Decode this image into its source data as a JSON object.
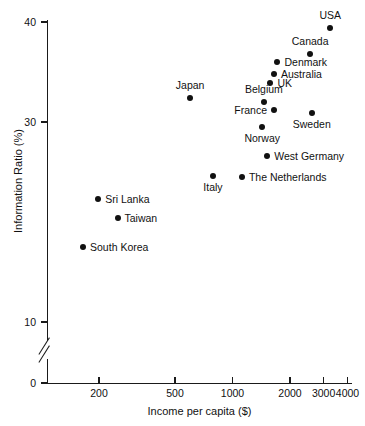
{
  "chart_data": {
    "type": "scatter",
    "title": "",
    "xlabel": "Income per capita ($)",
    "ylabel": "Information Ratio (%)",
    "x_scale": "log",
    "y_scale": "linear",
    "xlim": [
      150,
      4000
    ],
    "ylim": [
      0,
      41
    ],
    "y_axis_break": true,
    "y_break_between": [
      0,
      10
    ],
    "grid": false,
    "legend": "none",
    "xticks": [
      200,
      500,
      1000,
      2000,
      3000,
      4000
    ],
    "xtick_labels": [
      "200",
      "500",
      "1000",
      "2000",
      "3000",
      "4000"
    ],
    "yticks": [
      0,
      10,
      30,
      40
    ],
    "ytick_labels": [
      "0",
      "10",
      "30",
      "40"
    ],
    "points": [
      {
        "label": "USA",
        "x": 3250,
        "y": 39.4,
        "label_pos": "above"
      },
      {
        "label": "Canada",
        "x": 2550,
        "y": 36.8,
        "label_pos": "above"
      },
      {
        "label": "Denmark",
        "x": 1720,
        "y": 36.0,
        "label_pos": "right"
      },
      {
        "label": "Australia",
        "x": 1650,
        "y": 34.8,
        "label_pos": "right"
      },
      {
        "label": "UK",
        "x": 1580,
        "y": 33.9,
        "label_pos": "right"
      },
      {
        "label": "Japan",
        "x": 600,
        "y": 32.4,
        "label_pos": "above"
      },
      {
        "label": "Belgium",
        "x": 1460,
        "y": 32.0,
        "label_pos": "above"
      },
      {
        "label": "France",
        "x": 1650,
        "y": 31.2,
        "label_pos": "left"
      },
      {
        "label": "Sweden",
        "x": 2600,
        "y": 30.9,
        "label_pos": "below"
      },
      {
        "label": "Norway",
        "x": 1430,
        "y": 29.5,
        "label_pos": "below"
      },
      {
        "label": "West Germany",
        "x": 1520,
        "y": 26.6,
        "label_pos": "right"
      },
      {
        "label": "The Netherlands",
        "x": 1120,
        "y": 24.5,
        "label_pos": "right"
      },
      {
        "label": "Italy",
        "x": 790,
        "y": 24.6,
        "label_pos": "below"
      },
      {
        "label": "Sri Lanka",
        "x": 198,
        "y": 22.3,
        "label_pos": "right"
      },
      {
        "label": "Taiwan",
        "x": 250,
        "y": 20.4,
        "label_pos": "right"
      },
      {
        "label": "South Korea",
        "x": 165,
        "y": 17.5,
        "label_pos": "right"
      }
    ]
  },
  "colors": {
    "axis": "#1a1a1a",
    "marker": "#111111",
    "text": "#111111",
    "background": "#ffffff"
  }
}
